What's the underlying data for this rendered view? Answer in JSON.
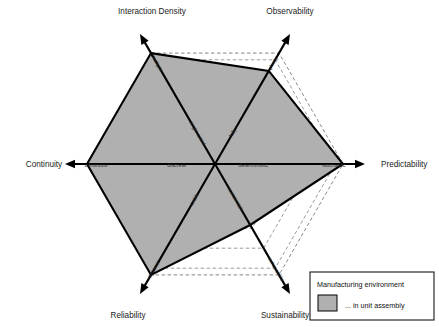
{
  "chart_data": {
    "type": "radar",
    "title": "",
    "center": {
      "x": 215,
      "y": 164
    },
    "max_radius": 128,
    "grid": "dashed concentric hexagons",
    "legend_position": "bottom-right",
    "axes": [
      {
        "title": "Interaction Density",
        "angle_deg": 120,
        "inner_label": "single-sided",
        "outer_label": "multiple",
        "value": 1.0
      },
      {
        "title": "Observability",
        "angle_deg": 60,
        "inner_label": "fully",
        "outer_label": "plenty",
        "value": 0.84
      },
      {
        "title": "Predictability",
        "angle_deg": 0,
        "inner_label": "deterministic",
        "outer_label": "stochastic",
        "value": 1.0
      },
      {
        "title": "Sustainability",
        "angle_deg": -60,
        "inner_label": "sustainable",
        "outer_label": "exhaustible",
        "value": 0.55
      },
      {
        "title": "Reliability",
        "angle_deg": -120,
        "inner_label": "stable",
        "outer_label": "dynamic",
        "value": 1.0
      },
      {
        "title": "Continuity",
        "angle_deg": 180,
        "inner_label": "discrete",
        "outer_label": "continous",
        "value": 1.0
      }
    ],
    "series": [
      {
        "name": "... in unit assembly",
        "values": [
          1.0,
          0.84,
          1.0,
          0.55,
          1.0,
          1.0
        ],
        "fill": "#b0b0b0",
        "stroke": "#000000"
      }
    ]
  },
  "legend": {
    "title": "Manufacturing environment",
    "swatch_label": "... in unit assembly",
    "swatch_color": "#b0b0b0"
  },
  "colors": {
    "axis": "#000000",
    "grid": "#555555",
    "fill": "#b0b0b0",
    "background": "#ffffff"
  }
}
